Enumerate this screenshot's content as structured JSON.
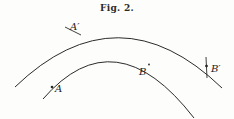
{
  "figure": {
    "caption": "Fig. 2.",
    "points": {
      "A": "A",
      "B": "B",
      "A_prime": "A′",
      "B_prime": "B′"
    },
    "arcs": [
      {
        "name": "outer-arc",
        "passes_through": [
          "A′",
          "B′"
        ]
      },
      {
        "name": "inner-arc",
        "passes_through": [
          "A",
          "B"
        ]
      }
    ],
    "colors": {
      "ink": "#2b2b2b",
      "paper": "#fdfdfc"
    }
  }
}
